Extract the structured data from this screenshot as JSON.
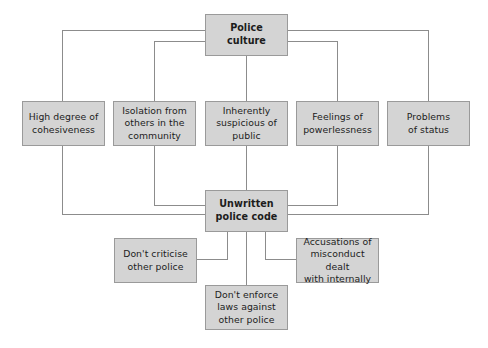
{
  "diagram": {
    "type": "flow-diagram",
    "colors": {
      "node_fill": "#d4d4d4",
      "node_border": "#9a9a9a",
      "connector": "#8c8c8c",
      "text": "#1c1c1c",
      "background": "#ffffff"
    },
    "nodes": {
      "police_culture": "Police\nculture",
      "police_culture_lines": [
        "Police",
        "culture"
      ],
      "cohesiveness": [
        "High degree of",
        "cohesiveness"
      ],
      "isolation": [
        "Isolation from",
        "others in the",
        "community"
      ],
      "suspicious": [
        "Inherently",
        "suspicious of",
        "public"
      ],
      "powerlessness": [
        "Feelings of",
        "powerlessness"
      ],
      "status": [
        "Problems",
        "of status"
      ],
      "unwritten_code": [
        "Unwritten",
        "police code"
      ],
      "dont_criticise": [
        "Don't criticise",
        "other police"
      ],
      "accusations": [
        "Accusations of",
        "misconduct dealt",
        "with internally"
      ],
      "dont_enforce": [
        "Don't enforce",
        "laws against",
        "other police"
      ]
    },
    "labels": {
      "police_culture": "Police culture",
      "cohesiveness": "High degree of cohesiveness",
      "isolation": "Isolation from others in the community",
      "suspicious": "Inherently suspicious of public",
      "powerlessness": "Feelings of powerlessness",
      "status": "Problems of status",
      "unwritten_code": "Unwritten police code",
      "dont_criticise": "Don't criticise other police",
      "accusations": "Accusations of misconduct dealt with internally",
      "dont_enforce": "Don't enforce laws against other police"
    },
    "edges": [
      {
        "from": "police_culture",
        "to": "cohesiveness"
      },
      {
        "from": "police_culture",
        "to": "isolation"
      },
      {
        "from": "police_culture",
        "to": "suspicious"
      },
      {
        "from": "police_culture",
        "to": "powerlessness"
      },
      {
        "from": "police_culture",
        "to": "status"
      },
      {
        "from": "cohesiveness",
        "to": "unwritten_code"
      },
      {
        "from": "isolation",
        "to": "unwritten_code"
      },
      {
        "from": "suspicious",
        "to": "unwritten_code"
      },
      {
        "from": "powerlessness",
        "to": "unwritten_code"
      },
      {
        "from": "status",
        "to": "unwritten_code"
      },
      {
        "from": "unwritten_code",
        "to": "dont_criticise"
      },
      {
        "from": "unwritten_code",
        "to": "dont_enforce"
      },
      {
        "from": "unwritten_code",
        "to": "accusations"
      }
    ]
  }
}
